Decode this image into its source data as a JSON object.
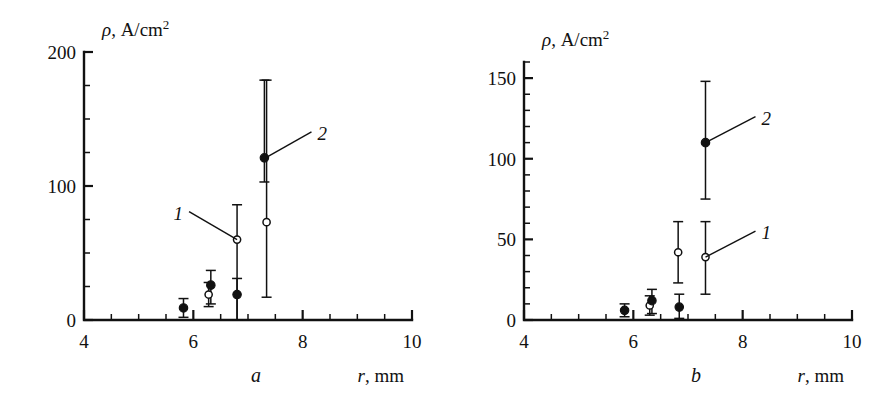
{
  "figure": {
    "type": "scientific-figure",
    "panel_count": 2
  },
  "chart_data": [
    {
      "type": "scatter",
      "panel": "a",
      "panel_letter": "a",
      "title": "",
      "ylabel": "ρ, A/cm²",
      "ylabel_symbol": "ρ",
      "ylabel_units": ", A/cm",
      "ylabel_exponent": "2",
      "xlabel": "r,  mm",
      "xlabel_symbol": "r",
      "xlabel_units": ",  mm",
      "xlim": [
        4,
        10
      ],
      "ylim": [
        0,
        200
      ],
      "xticks": [
        4,
        6,
        8,
        10
      ],
      "xticklabels": [
        "4",
        "6",
        "8",
        "10"
      ],
      "yticks": [
        0,
        100,
        200
      ],
      "yticklabels": [
        "0",
        "100",
        "200"
      ],
      "x_minor_step": 0.5,
      "y_minor_step": 25,
      "grid": false,
      "legend_position": "inline-annotations",
      "annotations": [
        {
          "text": "1",
          "points_to_series": "1",
          "points_to_x": 6.8,
          "points_to_y": 60
        },
        {
          "text": "2",
          "points_to_series": "2",
          "points_to_x": 7.32,
          "points_to_y": 121
        }
      ],
      "series": [
        {
          "name": "1",
          "marker": "open-circle",
          "points": [
            {
              "x": 6.28,
              "y": 19,
              "yerr_low": 9,
              "yerr_high": 9
            },
            {
              "x": 6.8,
              "y": 60,
              "yerr_low": 60,
              "yerr_high": 26
            },
            {
              "x": 7.34,
              "y": 73,
              "yerr_low": 56,
              "yerr_high": 106
            }
          ]
        },
        {
          "name": "2",
          "marker": "filled-circle",
          "points": [
            {
              "x": 5.82,
              "y": 9,
              "yerr_low": 7,
              "yerr_high": 7
            },
            {
              "x": 6.32,
              "y": 26,
              "yerr_low": 14,
              "yerr_high": 11
            },
            {
              "x": 6.8,
              "y": 19,
              "yerr_low": 19,
              "yerr_high": 12
            },
            {
              "x": 7.3,
              "y": 121,
              "yerr_low": 18,
              "yerr_high": 58
            }
          ]
        }
      ]
    },
    {
      "type": "scatter",
      "panel": "b",
      "panel_letter": "b",
      "title": "",
      "ylabel": "ρ, A/cm²",
      "ylabel_symbol": "ρ",
      "ylabel_units": ", A/cm",
      "ylabel_exponent": "2",
      "xlabel": "r,  mm",
      "xlabel_symbol": "r",
      "xlabel_units": ",  mm",
      "xlim": [
        4,
        10
      ],
      "ylim": [
        0,
        160
      ],
      "xticks": [
        4,
        6,
        8,
        10
      ],
      "xticklabels": [
        "4",
        "6",
        "8",
        "10"
      ],
      "yticks": [
        0,
        50,
        100,
        150
      ],
      "yticklabels": [
        "0",
        "50",
        "100",
        "150"
      ],
      "x_minor_step": 0.5,
      "y_minor_step": 10,
      "grid": false,
      "legend_position": "inline-annotations",
      "annotations": [
        {
          "text": "2",
          "points_to_series": "2",
          "points_to_x": 7.32,
          "points_to_y": 110
        },
        {
          "text": "1",
          "points_to_series": "1",
          "points_to_x": 7.32,
          "points_to_y": 39
        }
      ],
      "series": [
        {
          "name": "1",
          "marker": "open-circle",
          "points": [
            {
              "x": 6.3,
              "y": 9,
              "yerr_low": 6,
              "yerr_high": 6
            },
            {
              "x": 6.82,
              "y": 42,
              "yerr_low": 19,
              "yerr_high": 19
            },
            {
              "x": 7.32,
              "y": 39,
              "yerr_low": 23,
              "yerr_high": 22
            }
          ]
        },
        {
          "name": "2",
          "marker": "filled-circle",
          "points": [
            {
              "x": 5.84,
              "y": 6,
              "yerr_low": 4,
              "yerr_high": 4
            },
            {
              "x": 6.34,
              "y": 12,
              "yerr_low": 8,
              "yerr_high": 7
            },
            {
              "x": 6.84,
              "y": 8,
              "yerr_low": 7,
              "yerr_high": 8
            },
            {
              "x": 7.32,
              "y": 110,
              "yerr_low": 35,
              "yerr_high": 38
            }
          ]
        }
      ]
    }
  ]
}
